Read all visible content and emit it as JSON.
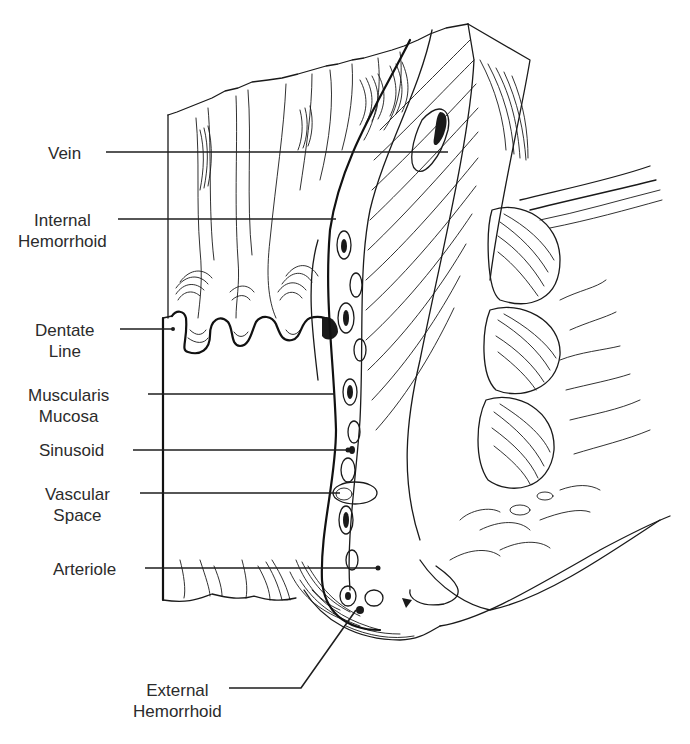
{
  "figure": {
    "type": "anatomical line drawing",
    "background_color": "#ffffff",
    "ink_color": "#1a1a1a"
  },
  "labels": [
    {
      "id": "vein",
      "lines": [
        "Vein"
      ],
      "pointer_to": [
        448,
        151
      ]
    },
    {
      "id": "internal-hemorrhoid",
      "lines": [
        "Internal",
        "Hemorrhoid"
      ],
      "pointer_to": [
        336,
        216
      ]
    },
    {
      "id": "dentate-line",
      "lines": [
        "Dentate",
        "Line"
      ],
      "pointer_to": [
        173,
        329
      ]
    },
    {
      "id": "muscularis-mucosa",
      "lines": [
        "Muscularis",
        "Mucosa"
      ],
      "pointer_to": [
        335,
        394
      ]
    },
    {
      "id": "sinusoid",
      "lines": [
        "Sinusoid"
      ],
      "pointer_to": [
        348,
        450
      ]
    },
    {
      "id": "vascular-space",
      "lines": [
        "Vascular",
        "Space"
      ],
      "pointer_to": [
        340,
        493
      ]
    },
    {
      "id": "arteriole",
      "lines": [
        "Arteriole"
      ],
      "pointer_to": [
        358,
        568
      ]
    },
    {
      "id": "external-hemorrhoid",
      "lines": [
        "External",
        "Hemorrhoid"
      ],
      "pointer_to": [
        356,
        610
      ]
    }
  ],
  "caption_cutoff": "(text partially cut off at bottom edge)"
}
